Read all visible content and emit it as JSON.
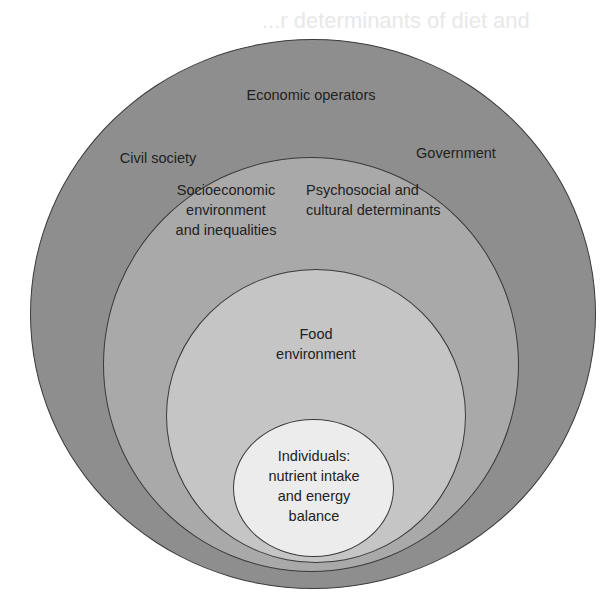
{
  "background_bleed": {
    "line1": "...r determinants of diet and",
    "line2": "...th"
  },
  "diagram": {
    "type": "nested-circles",
    "colors": {
      "outer": "#8e8e8e",
      "socioeconomic": "#a9a9a9",
      "food": "#c5c5c5",
      "individual": "#ececec",
      "outline": "#3a3a3a",
      "text": "#222222"
    },
    "outer_ring": {
      "labels": {
        "top": "Economic operators",
        "left": "Civil society",
        "right": "Government"
      }
    },
    "second_ring": {
      "labels": {
        "left": [
          "Socioeconomic",
          "environment",
          "and inequalities"
        ],
        "right": [
          "Psychosocial and",
          "cultural determinants"
        ]
      }
    },
    "third_ring": {
      "label": [
        "Food",
        "environment"
      ]
    },
    "core": {
      "label": [
        "Individuals:",
        "nutrient intake",
        "and energy",
        "balance"
      ]
    }
  }
}
